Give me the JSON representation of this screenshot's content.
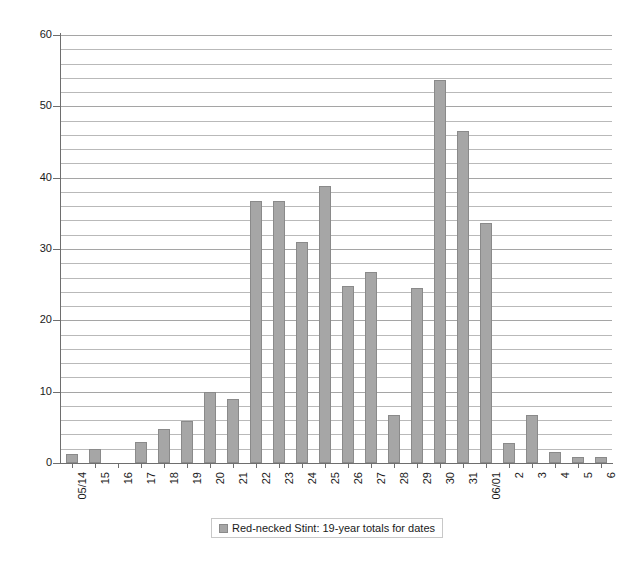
{
  "chart_data": {
    "type": "bar",
    "title": "",
    "subtitle": "",
    "xlabel": "",
    "ylabel": "",
    "ylim": [
      0,
      60
    ],
    "ytick_step": 10,
    "gridline_step": 2,
    "grid": true,
    "legend_position": "bottom-center",
    "categories": [
      "05/14",
      "15",
      "16",
      "17",
      "18",
      "19",
      "20",
      "21",
      "22",
      "23",
      "24",
      "25",
      "26",
      "27",
      "28",
      "29",
      "30",
      "31",
      "06/01",
      "2",
      "3",
      "4",
      "5",
      "6"
    ],
    "ytick_labels": [
      "0",
      "10",
      "20",
      "30",
      "40",
      "50",
      "60"
    ],
    "series": [
      {
        "name": "Red-necked Stint: 19-year totals for dates",
        "color": "#a6a6a6",
        "values": [
          1.3,
          1.9,
          0,
          3.0,
          4.8,
          5.9,
          10.0,
          9.0,
          36.8,
          36.8,
          31.0,
          38.8,
          24.8,
          26.8,
          6.7,
          24.6,
          53.7,
          46.6,
          33.6,
          2.8,
          6.7,
          1.6,
          0.8,
          0.8
        ]
      }
    ],
    "legend": [
      {
        "label": "Red-necked Stint: 19-year totals for dates",
        "color": "#a6a6a6"
      }
    ]
  },
  "colors": {
    "bar_fill": "#a6a6a6",
    "bar_border": "#8a8a8a",
    "gridline": "#b9b9b9",
    "axis": "#6e6e6e",
    "background": "#ffffff",
    "text": "#1a1a1a"
  }
}
